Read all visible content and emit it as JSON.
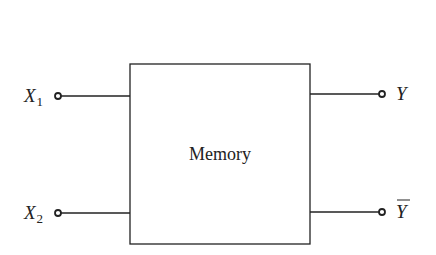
{
  "diagram": {
    "block": {
      "label": "Memory"
    },
    "inputs": [
      {
        "name": "X",
        "subscript": "1"
      },
      {
        "name": "X",
        "subscript": "2"
      }
    ],
    "outputs": [
      {
        "name": "Y",
        "overline": false
      },
      {
        "name": "Y",
        "overline": true
      }
    ],
    "colors": {
      "stroke": "#222222",
      "background": "#ffffff"
    }
  }
}
